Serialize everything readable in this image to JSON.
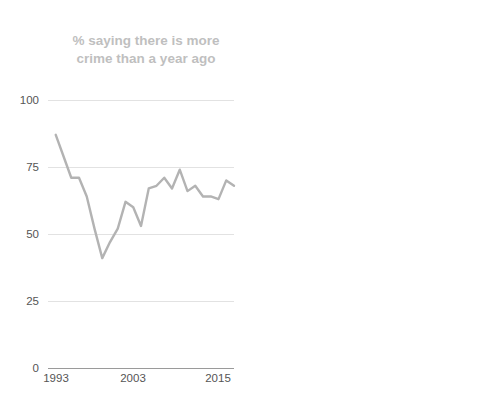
{
  "panels": {
    "left": {
      "title": "% saying there is more crime than a year ago",
      "title_color": "#bfbfbf",
      "line_color": "#b3b3b3"
    },
    "right": {
      "title": "Violent crimes per 1,000 people ages 12 and older",
      "title_color": "#000000",
      "line_color": "#000000"
    }
  },
  "chart_data": [
    {
      "type": "line",
      "title": "% saying there is more crime than a year ago",
      "xlabel": "",
      "ylabel": "",
      "ylim": [
        0,
        100
      ],
      "yticks": [
        0,
        25,
        50,
        75,
        100
      ],
      "ytick_labels": [
        "0",
        "25",
        "50",
        "75",
        "100"
      ],
      "xlim": [
        1992,
        2016
      ],
      "xticks": [
        1993,
        2003,
        2015
      ],
      "xtick_labels": [
        "1993",
        "2003",
        "2015"
      ],
      "grid": true,
      "legend": "none",
      "series": [
        {
          "name": "% saying there is more crime than a year ago",
          "color": "#b3b3b3",
          "x": [
            1993,
            1994,
            1995,
            1996,
            1997,
            1998,
            1999,
            2000,
            2001,
            2002,
            2003,
            2004,
            2005,
            2006,
            2007,
            2008,
            2009,
            2010,
            2011,
            2012,
            2013,
            2014,
            2015,
            2016
          ],
          "values": [
            87,
            79,
            71,
            71,
            64,
            52,
            41,
            47,
            52,
            62,
            60,
            53,
            67,
            68,
            71,
            67,
            74,
            66,
            68,
            64,
            64,
            63,
            70,
            68
          ]
        }
      ]
    },
    {
      "type": "line",
      "title": "Violent crimes per 1,000 people ages 12 and older",
      "xlabel": "",
      "ylabel": "",
      "ylim": [
        0,
        100
      ],
      "yticks": [
        0,
        25,
        50,
        75,
        100
      ],
      "ytick_labels": [
        "0",
        "25",
        "50",
        "75",
        "100"
      ],
      "xlim": [
        1992,
        2016
      ],
      "xticks": [
        1993,
        2003,
        2015
      ],
      "xtick_labels": [
        "1993",
        "2003",
        "2015"
      ],
      "grid": true,
      "legend": "none",
      "series": [
        {
          "name": "Violent crimes per 1,000 people ages 12 and older",
          "color": "#000000",
          "x": [
            1993,
            1994,
            1995,
            1996,
            1997,
            1998,
            1999,
            2000,
            2001,
            2002,
            2003,
            2004,
            2005,
            2006,
            2007,
            2008,
            2009,
            2010,
            2011,
            2012,
            2013,
            2014,
            2015,
            2016
          ],
          "values": [
            79,
            75,
            69,
            61,
            52,
            45,
            36,
            29,
            26,
            24,
            32,
            22,
            25,
            28,
            25,
            21,
            18,
            20,
            23,
            27,
            24,
            21,
            19,
            19
          ]
        }
      ]
    }
  ]
}
